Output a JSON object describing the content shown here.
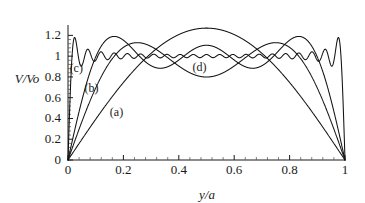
{
  "chart_data": {
    "type": "line",
    "title": "",
    "xlabel": "y/a",
    "ylabel": "V/Vo",
    "xlim": [
      0,
      1
    ],
    "ylim": [
      0,
      1.3
    ],
    "grid": false,
    "legend_position": "inline-annotations",
    "x_ticks": [
      "0",
      "0.2",
      "0.4",
      "0.6",
      "0.8",
      "1"
    ],
    "x_tick_values": [
      0,
      0.2,
      0.4,
      0.6,
      0.8,
      1
    ],
    "x_minor_tick_count": 4,
    "y_ticks": [
      "0",
      "0.2",
      "0.4",
      "0.6",
      "0.8",
      "1",
      "1.2"
    ],
    "y_tick_values": [
      0,
      0.2,
      0.4,
      0.6,
      0.8,
      1,
      1.2
    ],
    "y_minor_tick_count": 4,
    "series": [
      {
        "name": "(a)",
        "label": "(a)",
        "terms": 1,
        "color": "#111111",
        "peak_value": 1.27,
        "peak_x": 0.5,
        "label_x": 0.175,
        "label_y": 0.42
      },
      {
        "name": "(b)",
        "label": "(b)",
        "terms": 3,
        "color": "#111111",
        "peak_value": 1.13,
        "peak_x": 0.5,
        "label_x": 0.085,
        "label_y": 0.655
      },
      {
        "name": "(c)",
        "label": "(c)",
        "terms": 5,
        "color": "#111111",
        "peak_value": 1.19,
        "peak_x": 0.165,
        "label_x": 0.03,
        "label_y": 0.845
      },
      {
        "name": "(d)",
        "label": "(d)",
        "terms": 41,
        "color": "#111111",
        "peak_value": 1.18,
        "peak_x": 0.012,
        "label_x": 0.475,
        "label_y": 0.855
      }
    ]
  }
}
